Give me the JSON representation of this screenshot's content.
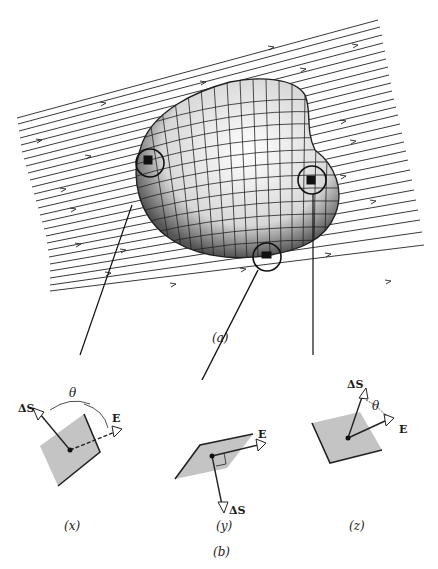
{
  "figure": {
    "part_a": {
      "caption": "(a)",
      "description": "Closed irregular surface with grid patches in a uniform electric field; three circled surface elements with leader lines",
      "field_line_color": "#222222",
      "surface_fill": "#dcdcdc"
    },
    "part_b": {
      "caption": "(b)",
      "panels": [
        {
          "id": "x",
          "caption": "(x)",
          "vector_area_label": "ΔS",
          "field_label": "E",
          "angle_label": "θ"
        },
        {
          "id": "y",
          "caption": "(y)",
          "vector_area_label": "ΔS",
          "field_label": "E"
        },
        {
          "id": "z",
          "caption": "(z)",
          "vector_area_label": "ΔS",
          "field_label": "E",
          "angle_label": "θ"
        }
      ],
      "patch_color": "#c4c4c4"
    }
  }
}
